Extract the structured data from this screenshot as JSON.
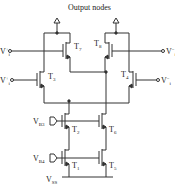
{
  "diagram": {
    "title": "Output nodes",
    "transistors": [
      {
        "id": "T7",
        "label": "T",
        "sub": "7"
      },
      {
        "id": "T8",
        "label": "T",
        "sub": "8"
      },
      {
        "id": "T3",
        "label": "T",
        "sub": "3"
      },
      {
        "id": "T4",
        "label": "T",
        "sub": "4"
      },
      {
        "id": "T2",
        "label": "T",
        "sub": "2"
      },
      {
        "id": "T6",
        "label": "T",
        "sub": "6"
      },
      {
        "id": "T1",
        "label": "T",
        "sub": "1"
      },
      {
        "id": "T5",
        "label": "T",
        "sub": "5"
      }
    ],
    "inputs": [
      {
        "id": "vi_plus_top",
        "label": "V",
        "sub": "i",
        "sup": "+"
      },
      {
        "id": "vi_plus_bottom",
        "label": "V",
        "sub": "i",
        "sup": "+"
      },
      {
        "id": "vi_minus_top",
        "label": "V",
        "sub": "i",
        "sup": "−"
      },
      {
        "id": "vi_minus_bottom",
        "label": "V",
        "sub": "i",
        "sup": "−"
      }
    ],
    "bias": [
      {
        "id": "VB3",
        "label": "V",
        "sub": "B3"
      },
      {
        "id": "VB4",
        "label": "V",
        "sub": "B4"
      }
    ],
    "supply": {
      "label": "V",
      "sub": "SS"
    }
  }
}
